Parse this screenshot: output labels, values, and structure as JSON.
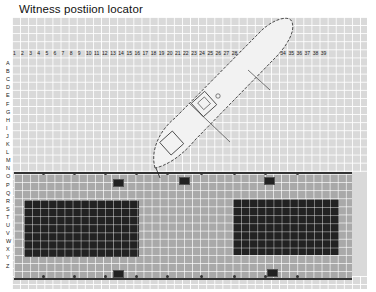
{
  "title": "Witness postiion locator",
  "grid": {
    "columns": [
      "1",
      "2",
      "3",
      "4",
      "5",
      "6",
      "7",
      "8",
      "9",
      "10",
      "11",
      "12",
      "13",
      "14",
      "15",
      "16",
      "17",
      "18",
      "19",
      "20",
      "21",
      "22",
      "23",
      "24",
      "25",
      "26",
      "27",
      "28",
      "29",
      "30",
      "31",
      "32",
      "33",
      "34",
      "35",
      "36",
      "37",
      "38",
      "39"
    ],
    "rows": [
      "A",
      "B",
      "C",
      "D",
      "E",
      "F",
      "G",
      "H",
      "I",
      "J",
      "K",
      "L",
      "M",
      "N",
      "O",
      "P",
      "Q",
      "R",
      "S",
      "T",
      "U",
      "V",
      "W",
      "X",
      "Y",
      "Z"
    ]
  },
  "colors": {
    "grid_background": "#d9d9d9",
    "grid_lines": "#ffffff",
    "dock": "#a9a9a9",
    "blocks": "#222222",
    "vessel": "#f2f2f2"
  },
  "objects": {
    "vessel": "ship-outline",
    "dock": "quay",
    "blocks": [
      "container-block-left",
      "container-block-right"
    ]
  }
}
